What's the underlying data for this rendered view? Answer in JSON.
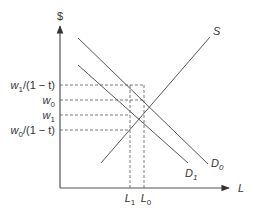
{
  "diagram": {
    "type": "supply-demand",
    "colors": {
      "line": "#555555",
      "text": "#333333",
      "background": "#ffffff"
    },
    "axes": {
      "y_label": "$",
      "x_label": "L"
    },
    "curves": {
      "supply": {
        "label": "S"
      },
      "demand0": {
        "label": "D",
        "sub": "0"
      },
      "demand1": {
        "label": "D",
        "sub": "1"
      }
    },
    "y_ticks": [
      {
        "id": "w1_over_1mt",
        "main": "w",
        "sub": "1",
        "rest": "/(1 − t)"
      },
      {
        "id": "w0",
        "main": "w",
        "sub": "0",
        "rest": ""
      },
      {
        "id": "w1",
        "main": "w",
        "sub": "1",
        "rest": ""
      },
      {
        "id": "w0_over_1mt",
        "main": "w",
        "sub": "0",
        "rest": "/(1 − t)"
      }
    ],
    "x_ticks": [
      {
        "id": "L1",
        "main": "L",
        "sub": "1"
      },
      {
        "id": "L0",
        "main": "L",
        "sub": "0"
      }
    ]
  }
}
